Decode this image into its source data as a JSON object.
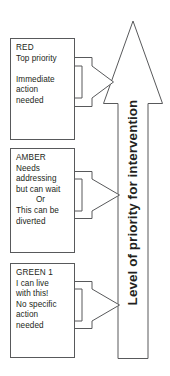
{
  "diagram": {
    "title": "Level of priority for intervention",
    "axis_label": "Level of priority for intervention",
    "stroke_color": "#58595b",
    "text_color": "#231f20",
    "background": "#ffffff",
    "main_arrow_direction": "up",
    "levels": [
      {
        "id": "red",
        "heading": "RED",
        "lines": [
          {
            "text": "RED",
            "style": "head"
          },
          {
            "text": "Top priority",
            "style": "normal"
          },
          {
            "text": "",
            "style": "blank"
          },
          {
            "text": "Immediate",
            "style": "normal"
          },
          {
            "text": "action",
            "style": "normal"
          },
          {
            "text": "needed",
            "style": "normal"
          }
        ]
      },
      {
        "id": "amber",
        "heading": "AMBER",
        "lines": [
          {
            "text": "AMBER",
            "style": "head"
          },
          {
            "text": "Needs",
            "style": "normal"
          },
          {
            "text": "addressing",
            "style": "normal"
          },
          {
            "text": "but can wait",
            "style": "normal"
          },
          {
            "text": "Or",
            "style": "center"
          },
          {
            "text": "This can be",
            "style": "normal"
          },
          {
            "text": "diverted",
            "style": "normal"
          }
        ]
      },
      {
        "id": "green",
        "heading": "GREEN 1",
        "lines": [
          {
            "text": "GREEN 1",
            "style": "head"
          },
          {
            "text": "I can live",
            "style": "normal"
          },
          {
            "text": "with this!",
            "style": "normal"
          },
          {
            "text": "No specific",
            "style": "normal"
          },
          {
            "text": "action",
            "style": "normal"
          },
          {
            "text": "needed",
            "style": "normal"
          }
        ]
      }
    ]
  }
}
